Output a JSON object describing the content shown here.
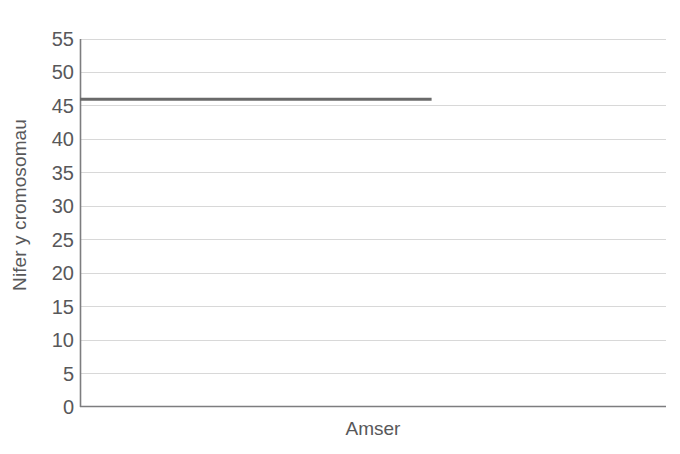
{
  "chart_data": {
    "type": "line",
    "title": "",
    "xlabel": "Amser",
    "ylabel": "Nifer y cromosomau",
    "ylim": [
      0,
      55
    ],
    "yticks": [
      0,
      5,
      10,
      15,
      20,
      25,
      30,
      35,
      40,
      45,
      50,
      55
    ],
    "ytick_labels": [
      "0",
      "5",
      "10",
      "15",
      "20",
      "25",
      "30",
      "35",
      "40",
      "45",
      "50",
      "55"
    ],
    "xticks": [],
    "xtick_labels": [],
    "xlim": [
      0,
      100
    ],
    "grid": "horizontal",
    "legend": "none",
    "series": [
      {
        "name": "Nifer y cromosomau",
        "color": "#6a6a6a",
        "x": [
          0,
          60
        ],
        "values": [
          46,
          46
        ]
      }
    ]
  },
  "style": {
    "background": "#ffffff",
    "gridline_color": "#d8d8d8",
    "axis_color": "#7d7d7f",
    "text_color": "#58585a",
    "data_line_color": "#6a6a6a"
  }
}
